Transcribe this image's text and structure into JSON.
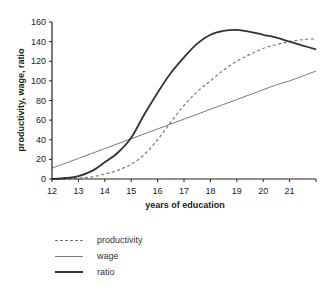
{
  "chart_data": {
    "type": "line",
    "title": "",
    "xlabel": "years of education",
    "ylabel": "productivity, wage, ratio",
    "xlim": [
      12,
      22
    ],
    "ylim": [
      0,
      160
    ],
    "x_ticks": [
      12,
      13,
      14,
      15,
      16,
      17,
      18,
      19,
      20,
      21
    ],
    "y_ticks": [
      0,
      20,
      40,
      60,
      80,
      100,
      120,
      140,
      160
    ],
    "grid": false,
    "legend_position": "bottom-left",
    "x": [
      12,
      12.5,
      13,
      13.5,
      14,
      14.5,
      15,
      15.5,
      16,
      16.5,
      17,
      17.5,
      18,
      18.5,
      19,
      19.5,
      20,
      20.5,
      21,
      21.5,
      22
    ],
    "series": [
      {
        "name": "productivity",
        "style": "dashed",
        "color": "#777777",
        "values": [
          0,
          0,
          1,
          2,
          5,
          9,
          15,
          25,
          40,
          58,
          75,
          89,
          100,
          111,
          120,
          127,
          133,
          137,
          140,
          142,
          143
        ]
      },
      {
        "name": "wage",
        "style": "solid-thin",
        "color": "#777777",
        "values": [
          11,
          16,
          21,
          26,
          31,
          36,
          41,
          46,
          51,
          56,
          61,
          66,
          71,
          76,
          81,
          86,
          91,
          96,
          100,
          105,
          110
        ]
      },
      {
        "name": "ratio",
        "style": "solid-thick",
        "color": "#333333",
        "values": [
          0,
          1,
          3,
          8,
          17,
          27,
          42,
          66,
          88,
          108,
          124,
          138,
          147,
          151,
          152,
          150,
          147,
          144,
          140,
          136,
          132
        ]
      }
    ]
  },
  "legend": {
    "items": [
      {
        "label": "productivity"
      },
      {
        "label": "wage"
      },
      {
        "label": "ratio"
      }
    ]
  }
}
